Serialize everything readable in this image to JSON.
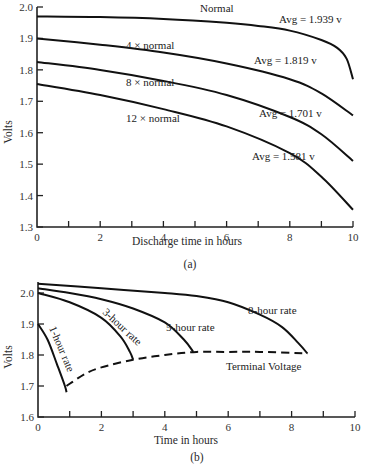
{
  "chart_data": [
    {
      "id": "a",
      "type": "line",
      "title": "",
      "caption": "(a)",
      "xlabel": "Discharge time in hours",
      "ylabel": "Volts",
      "xlim": [
        0,
        10
      ],
      "ylim": [
        1.3,
        2.0
      ],
      "xticks": [
        0,
        2,
        4,
        6,
        8,
        10
      ],
      "xminor": [
        1,
        3,
        5,
        7,
        9
      ],
      "yticks": [
        1.3,
        1.4,
        1.5,
        1.6,
        1.7,
        1.8,
        1.9,
        2.0
      ],
      "grid": false,
      "series": [
        {
          "name": "Normal",
          "avg_label": "Avg = 1.939 v",
          "x": [
            0,
            2,
            4,
            6,
            7,
            8,
            9,
            9.5,
            9.8,
            10
          ],
          "y": [
            1.97,
            1.968,
            1.962,
            1.95,
            1.94,
            1.925,
            1.895,
            1.87,
            1.835,
            1.77
          ]
        },
        {
          "name": "4 × normal",
          "avg_label": "Avg = 1.819 v",
          "x": [
            0,
            2,
            4,
            6,
            8,
            9,
            10
          ],
          "y": [
            1.9,
            1.88,
            1.855,
            1.82,
            1.77,
            1.725,
            1.655
          ]
        },
        {
          "name": "8 × normal",
          "avg_label": "Avg = 1.701 v",
          "x": [
            0,
            2,
            4,
            6,
            8,
            9,
            10
          ],
          "y": [
            1.825,
            1.8,
            1.765,
            1.72,
            1.65,
            1.595,
            1.51
          ]
        },
        {
          "name": "12 × normal",
          "avg_label": "Avg = 1.581 v",
          "x": [
            0,
            2,
            4,
            6,
            8,
            9,
            10
          ],
          "y": [
            1.755,
            1.72,
            1.675,
            1.62,
            1.535,
            1.46,
            1.355
          ]
        }
      ]
    },
    {
      "id": "b",
      "type": "line",
      "title": "",
      "caption": "(b)",
      "xlabel": "Time in hours",
      "ylabel": "Volts",
      "xlim": [
        0,
        10
      ],
      "ylim": [
        1.6,
        2.05
      ],
      "xticks": [
        0,
        2,
        4,
        6,
        8,
        10
      ],
      "xminor": [
        1,
        3,
        5,
        7,
        9
      ],
      "yticks": [
        1.6,
        1.7,
        1.8,
        1.9,
        2.0
      ],
      "grid": false,
      "series": [
        {
          "name": "1-hour rate",
          "x": [
            0.0,
            0.3,
            0.6,
            0.85,
            0.9
          ],
          "y": [
            1.9,
            1.85,
            1.77,
            1.7,
            1.68
          ]
        },
        {
          "name": "3-hour rate",
          "x": [
            0,
            1,
            2,
            2.6,
            2.9,
            3.0
          ],
          "y": [
            2.0,
            1.97,
            1.92,
            1.86,
            1.81,
            1.785
          ]
        },
        {
          "name": "5-hour rate",
          "x": [
            0,
            1,
            2,
            3,
            4,
            4.6,
            4.9
          ],
          "y": [
            2.015,
            2.0,
            1.98,
            1.95,
            1.905,
            1.85,
            1.81
          ]
        },
        {
          "name": "8-hour rate",
          "x": [
            0,
            2,
            4,
            5,
            6,
            7,
            7.7,
            8.2,
            8.5
          ],
          "y": [
            2.03,
            2.015,
            2.0,
            1.99,
            1.97,
            1.93,
            1.89,
            1.84,
            1.805
          ]
        },
        {
          "name": "Terminal Voltage",
          "style": "dashed",
          "x": [
            0.9,
            1.5,
            2.0,
            3.0,
            4.0,
            5.0,
            6.0,
            7.0,
            8.5
          ],
          "y": [
            1.7,
            1.74,
            1.76,
            1.785,
            1.8,
            1.81,
            1.81,
            1.81,
            1.805
          ]
        }
      ]
    }
  ],
  "labels": {
    "a_normal": "Normal",
    "a_4x": "4 × normal",
    "a_8x": "8 × normal",
    "a_12x": "12 × normal",
    "a_avg1": "Avg = 1.939 v",
    "a_avg2": "Avg = 1.819 v",
    "a_avg3": "Avg = 1.701 v",
    "a_avg4": "Avg = 1.581 v",
    "b_1h": "1-hour rate",
    "b_3h": "3-hour rate",
    "b_5h": "5-hour rate",
    "b_8h": "8-hour rate",
    "b_term": "Terminal Voltage"
  }
}
